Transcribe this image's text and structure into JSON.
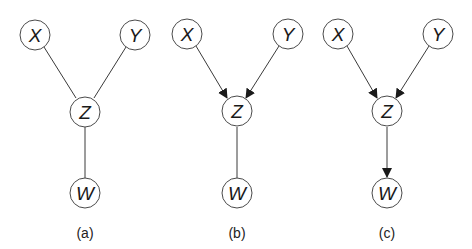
{
  "figure": {
    "panels": [
      {
        "label": "(a)",
        "nodes": {
          "X": "X",
          "Y": "Y",
          "Z": "Z",
          "W": "W"
        },
        "edges": [
          {
            "from": "X",
            "to": "Z",
            "directed": false
          },
          {
            "from": "Y",
            "to": "Z",
            "directed": false
          },
          {
            "from": "Z",
            "to": "W",
            "directed": false
          }
        ]
      },
      {
        "label": "(b)",
        "nodes": {
          "X": "X",
          "Y": "Y",
          "Z": "Z",
          "W": "W"
        },
        "edges": [
          {
            "from": "X",
            "to": "Z",
            "directed": true
          },
          {
            "from": "Y",
            "to": "Z",
            "directed": true
          },
          {
            "from": "Z",
            "to": "W",
            "directed": false
          }
        ]
      },
      {
        "label": "(c)",
        "nodes": {
          "X": "X",
          "Y": "Y",
          "Z": "Z",
          "W": "W"
        },
        "edges": [
          {
            "from": "X",
            "to": "Z",
            "directed": true
          },
          {
            "from": "Y",
            "to": "Z",
            "directed": true
          },
          {
            "from": "Z",
            "to": "W",
            "directed": true
          }
        ]
      }
    ],
    "colors": {
      "stroke": "#3a3a3a",
      "fill": "#ffffff",
      "text": "#1a1a1a"
    }
  }
}
